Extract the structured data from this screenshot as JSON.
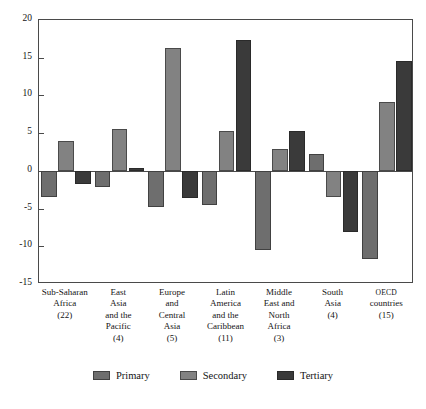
{
  "chart_data": {
    "type": "bar",
    "title": "",
    "subtitle": "",
    "xlabel": "",
    "ylabel": "",
    "ylim": [
      -15,
      20
    ],
    "yticks": [
      20,
      15,
      10,
      5,
      0,
      -5,
      -10,
      -15
    ],
    "ytick_labels": [
      "20",
      "15",
      "10",
      "5",
      "0",
      "-5",
      "-10",
      "-15"
    ],
    "grid": false,
    "legend_position": "bottom",
    "categories": [
      "Sub-Saharan Africa (22)",
      "East Asia and the Pacific (4)",
      "Europe and Central Asia (5)",
      "Latin America and the Caribbean (11)",
      "Middle East and North Africa (3)",
      "South Asia (4)",
      "OECD countries (15)"
    ],
    "category_lines": [
      [
        "Sub-Saharan",
        "Africa",
        "(22)"
      ],
      [
        "East",
        "Asia",
        "and the",
        "Pacific",
        "(4)"
      ],
      [
        "Europe",
        "and",
        "Central",
        "Asia",
        "(5)"
      ],
      [
        "Latin",
        "America",
        "and the",
        "Caribbean",
        "(11)"
      ],
      [
        "Middle",
        "East and",
        "North",
        "Africa",
        "(3)"
      ],
      [
        "South",
        "Asia",
        "(4)"
      ],
      [
        "OECD",
        "countries",
        "(15)"
      ]
    ],
    "series": [
      {
        "name": "Primary",
        "color": "#6e6e6e",
        "values": [
          -3.5,
          -2.2,
          -4.8,
          -4.5,
          -10.5,
          2.2,
          -11.7
        ]
      },
      {
        "name": "Secondary",
        "color": "#828282",
        "values": [
          4.0,
          5.6,
          16.3,
          5.3,
          2.9,
          -3.5,
          9.1
        ]
      },
      {
        "name": "Tertiary",
        "color": "#3a3a3a",
        "values": [
          -1.7,
          0.4,
          -3.6,
          17.4,
          5.3,
          -8.1,
          14.6
        ]
      }
    ]
  },
  "legend": {
    "items": [
      {
        "label": "Primary",
        "color": "#6e6e6e"
      },
      {
        "label": "Secondary",
        "color": "#828282"
      },
      {
        "label": "Tertiary",
        "color": "#3a3a3a"
      }
    ]
  },
  "axis": {
    "frame_color": "#4a4a4a"
  }
}
